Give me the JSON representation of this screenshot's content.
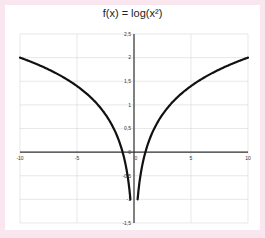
{
  "chart_data": {
    "type": "line",
    "title": "f(x) = log(x²)",
    "xlabel": "",
    "ylabel": "",
    "xlim": [
      -10,
      10
    ],
    "ylim": [
      -1.5,
      2.5
    ],
    "grid": true,
    "legend": null,
    "x_ticks": [
      "-10",
      "-5",
      "0",
      "5",
      "10"
    ],
    "y_ticks": [
      "2,5",
      "2",
      "1,5",
      "1",
      "0,5",
      "0",
      "-0,5",
      "-1",
      "-1,5"
    ],
    "series": [
      {
        "name": "f(x) = log(x²)",
        "color": "#111111",
        "x": [
          -10,
          -8,
          -6,
          -5,
          -4,
          -3,
          -2,
          -1.5,
          -1,
          -0.7,
          -0.5,
          -0.4,
          -0.316,
          0.316,
          0.4,
          0.5,
          0.7,
          1,
          1.5,
          2,
          3,
          4,
          5,
          6,
          8,
          10
        ],
        "y": [
          2,
          1.81,
          1.56,
          1.4,
          1.2,
          0.95,
          0.6,
          0.35,
          0,
          -0.31,
          -0.6,
          -0.8,
          -1,
          -1,
          -0.8,
          -0.6,
          -0.31,
          0,
          0.35,
          0.6,
          0.95,
          1.2,
          1.4,
          1.56,
          1.81,
          2
        ]
      }
    ]
  },
  "colors": {
    "background": "#f9e6ef",
    "card": "#ffffff",
    "grid": "#d9d9d9",
    "axis": "#333333",
    "curve": "#111111"
  }
}
